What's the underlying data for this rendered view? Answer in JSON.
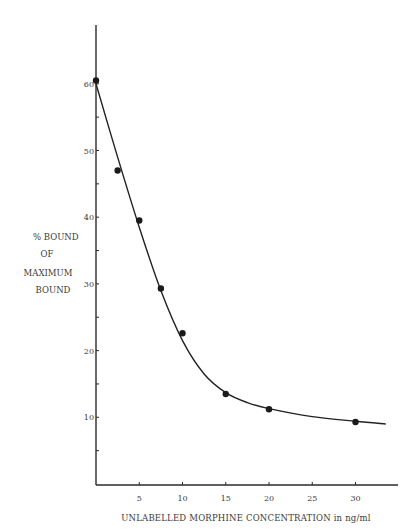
{
  "chart_data": {
    "type": "line",
    "title": "",
    "xlabel": "UNLABELLED MORPHINE CONCENTRATION in ng/ml",
    "ylabel": "% BOUND OF MAXIMUM BOUND",
    "ylabel_lines": [
      "% BOUND",
      "OF",
      "MAXIMUM",
      "BOUND"
    ],
    "xlim": [
      0,
      35
    ],
    "ylim": [
      0,
      70
    ],
    "x_ticks": [
      5,
      10,
      15,
      20,
      25,
      30
    ],
    "x_tick_labels": [
      "5",
      "10",
      "15",
      "20",
      "25",
      "30"
    ],
    "y_major_ticks": [
      10,
      20,
      30,
      40,
      50,
      60
    ],
    "y_tick_labels": [
      "10",
      "20",
      "30",
      "40",
      "50",
      "60"
    ],
    "y_minor_ticks": [
      5,
      15,
      25,
      35,
      45,
      55
    ],
    "grid": false,
    "legend": null,
    "series": [
      {
        "name": "Measured",
        "style": "markers",
        "x": [
          0,
          2.5,
          5,
          7.5,
          10,
          15,
          20,
          30
        ],
        "y": [
          60.5,
          47.0,
          39.5,
          29.3,
          22.6,
          13.5,
          11.2,
          9.3
        ]
      },
      {
        "name": "Fitted curve",
        "style": "smooth-line",
        "x": [
          0,
          2.5,
          5,
          7.5,
          10,
          12.5,
          15,
          17.5,
          20,
          25,
          30,
          33.5
        ],
        "y": [
          60,
          49.0,
          38.5,
          29.0,
          21.5,
          16.5,
          13.7,
          12.2,
          11.3,
          10.1,
          9.4,
          9.0
        ]
      }
    ]
  }
}
